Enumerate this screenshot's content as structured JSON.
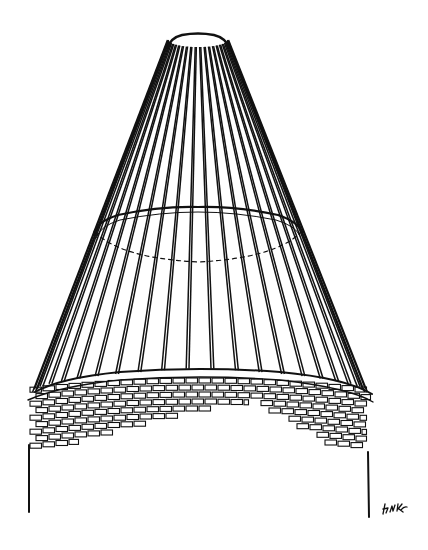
{
  "figure": {
    "style": "black ink line drawing on white",
    "ink_color": "#111111",
    "background_color": "#ffffff"
  },
  "cone": {
    "rib_count": 22,
    "rings": [
      "top-rim",
      "middle-ring"
    ],
    "middle_ring_back_edge": "dashed"
  },
  "base": {
    "material": "brick",
    "walls": [
      "left-wall",
      "right-wall"
    ]
  },
  "signature": {
    "label": "artist-initials",
    "legible": false
  }
}
